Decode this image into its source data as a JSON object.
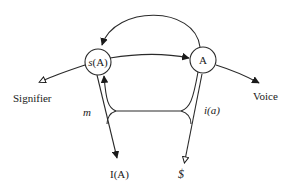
{
  "diagram": {
    "nodes": {
      "code_node": {
        "label": "A",
        "id": "A"
      },
      "message_node": {
        "label_prefix": "s",
        "label_suffix": "(A)",
        "id": "s(A)"
      }
    },
    "terminals": {
      "signifier": "Signifier",
      "voice": "Voice",
      "ideal": "I(A)",
      "subject": "$"
    },
    "edge_labels": {
      "m": "m",
      "ia": "i(a)"
    },
    "colors": {
      "stroke": "#2a2a2a",
      "background": "#ffffff",
      "text": "#1a1a1a"
    }
  }
}
